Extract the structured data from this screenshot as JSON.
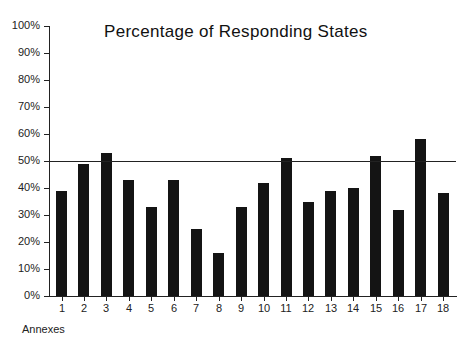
{
  "chart_data": {
    "type": "bar",
    "title": "Percentage of Responding States",
    "xlabel": "Annexes",
    "ylabel": "",
    "categories": [
      "1",
      "2",
      "3",
      "4",
      "5",
      "6",
      "7",
      "8",
      "9",
      "10",
      "11",
      "12",
      "13",
      "14",
      "15",
      "16",
      "17",
      "18"
    ],
    "values": [
      39,
      49,
      53,
      43,
      33,
      43,
      25,
      16,
      33,
      42,
      51,
      35,
      39,
      40,
      52,
      32,
      58,
      38
    ],
    "ylim": [
      0,
      100
    ],
    "yticks": [
      "0%",
      "10%",
      "20%",
      "30%",
      "40%",
      "50%",
      "60%",
      "70%",
      "80%",
      "90%",
      "100%"
    ],
    "reference_line": {
      "value": 50,
      "label": ""
    },
    "grid": false,
    "legend": null,
    "bar_color": "#141414"
  }
}
